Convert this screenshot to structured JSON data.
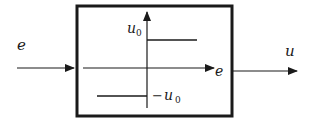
{
  "diagram": {
    "type": "block-diagram",
    "input": {
      "label": "e"
    },
    "output": {
      "label": "u"
    },
    "block": {
      "characteristic": "relay",
      "x_axis_label": "e",
      "y_axis_label": "u",
      "upper_level": {
        "symbol": "u",
        "subscript": "0"
      },
      "lower_level": {
        "prefix": "−",
        "symbol": "u",
        "subscript": "0"
      }
    },
    "colors": {
      "stroke": "#1a1a1a",
      "background": "#ffffff"
    }
  }
}
